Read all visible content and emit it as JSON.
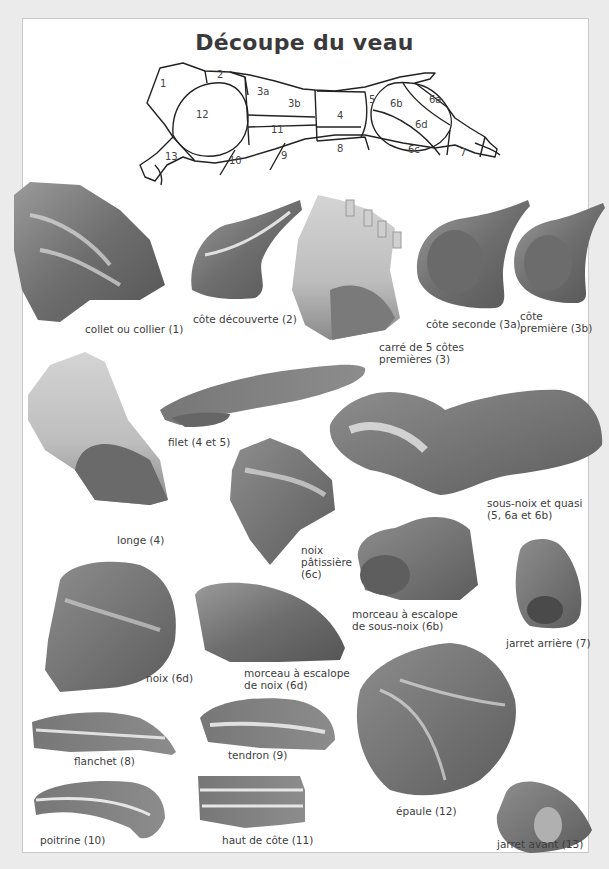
{
  "title": "Découpe du veau",
  "diagram": {
    "regions": [
      "1",
      "2",
      "3a",
      "3b",
      "4",
      "5",
      "6a",
      "6b",
      "6c",
      "6d",
      "7",
      "8",
      "9",
      "10",
      "11",
      "12",
      "13"
    ]
  },
  "cuts": [
    {
      "id": "collet",
      "label": "collet ou collier (1)"
    },
    {
      "id": "cote-decouverte",
      "label": "côte découverte (2)"
    },
    {
      "id": "carre",
      "label_line1": "carré de 5 côtes",
      "label_line2": "premières (3)"
    },
    {
      "id": "cote-seconde",
      "label": "côte seconde (3a)"
    },
    {
      "id": "cote-premiere",
      "label_line1": "côte",
      "label_line2": "première (3b)"
    },
    {
      "id": "longe",
      "label": "longe (4)"
    },
    {
      "id": "filet",
      "label": "filet (4 et 5)"
    },
    {
      "id": "sous-noix-quasi",
      "label_line1": "sous-noix et quasi",
      "label_line2": "(5, 6a et 6b)"
    },
    {
      "id": "noix-patissiere",
      "label_line1": "noix",
      "label_line2": "pâtissière",
      "label_line3": "(6c)"
    },
    {
      "id": "escalope-sous-noix",
      "label_line1": "morceau à escalope",
      "label_line2": "de sous-noix (6b)"
    },
    {
      "id": "jarret-arriere",
      "label": "jarret arrière (7)"
    },
    {
      "id": "noix",
      "label": "noix (6d)"
    },
    {
      "id": "escalope-noix",
      "label_line1": "morceau à escalope",
      "label_line2": "de noix (6d)"
    },
    {
      "id": "epaule",
      "label": "épaule (12)"
    },
    {
      "id": "flanchet",
      "label": "flanchet (8)"
    },
    {
      "id": "tendron",
      "label": "tendron (9)"
    },
    {
      "id": "poitrine",
      "label": "poitrine (10)"
    },
    {
      "id": "haut-de-cote",
      "label": "haut de côte (11)"
    },
    {
      "id": "jarret-avant",
      "label": "jarret avant (13)"
    }
  ]
}
